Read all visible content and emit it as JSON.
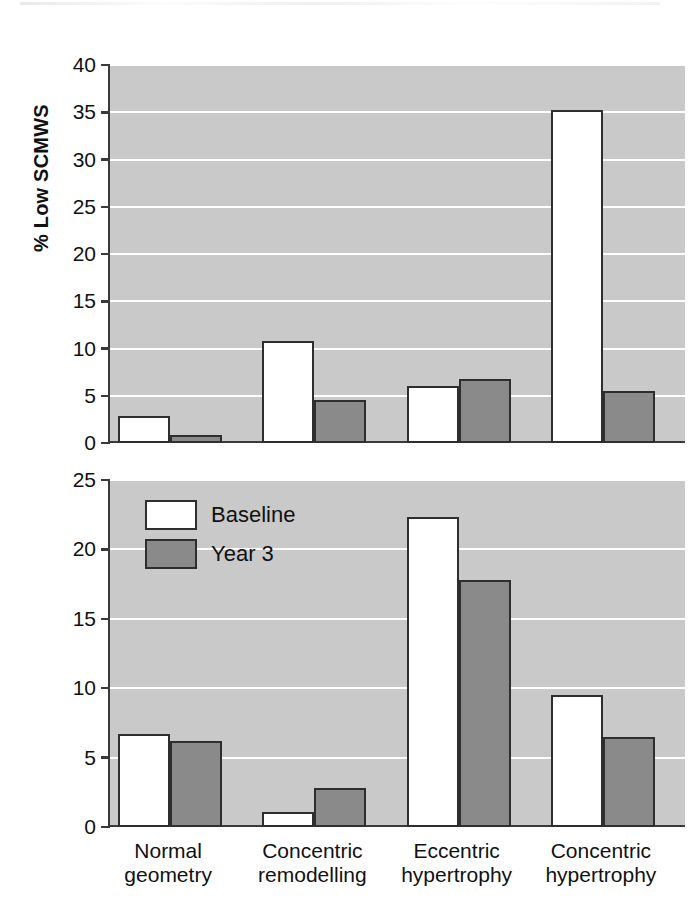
{
  "figure": {
    "width": 693,
    "height": 922,
    "background": "#ffffff",
    "plot_background": "#c9c9c9",
    "gridline_color": "#ffffff",
    "axis_color": "#3a3a3a",
    "bar_edge_color": "#2e2e2e"
  },
  "legend": {
    "position": "top-left of lower panel",
    "entries": [
      {
        "label": "Baseline",
        "color": "#ffffff",
        "swatch_name": "legend-swatch-baseline"
      },
      {
        "label": "Year 3",
        "color": "#8a8a8a",
        "swatch_name": "legend-swatch-year3"
      }
    ]
  },
  "chart_data": [
    {
      "type": "bar",
      "id": "scmws",
      "title": "",
      "ylabel": "% Low SCMWS",
      "xlabel": "",
      "ylim": [
        0,
        40
      ],
      "yticks": [
        0,
        5,
        10,
        15,
        20,
        25,
        30,
        35,
        40
      ],
      "ytick_labels": [
        "0",
        "5",
        "10",
        "15",
        "20",
        "25",
        "30",
        "35",
        "40"
      ],
      "grid": true,
      "grid_axis": "y",
      "categories": [
        "Normal\ngeometry",
        "Concentric\nremodelling",
        "Eccentric\nhypertrophy",
        "Concentric\nhypertrophy"
      ],
      "series": [
        {
          "name": "Baseline",
          "color": "#ffffff",
          "values": [
            2.9,
            10.8,
            6.0,
            35.2
          ]
        },
        {
          "name": "Year 3",
          "color": "#8a8a8a",
          "values": [
            0.8,
            4.5,
            6.8,
            5.5
          ]
        }
      ]
    },
    {
      "type": "bar",
      "id": "fs",
      "title": "",
      "ylabel": "% Low FS",
      "xlabel": "",
      "ylim": [
        0,
        25
      ],
      "yticks": [
        0,
        5,
        10,
        15,
        20,
        25
      ],
      "ytick_labels": [
        "0",
        "5",
        "10",
        "15",
        "20",
        "25"
      ],
      "grid": true,
      "grid_axis": "y",
      "categories": [
        "Normal\ngeometry",
        "Concentric\nremodelling",
        "Eccentric\nhypertrophy",
        "Concentric\nhypertrophy"
      ],
      "series": [
        {
          "name": "Baseline",
          "color": "#ffffff",
          "values": [
            6.7,
            1.1,
            22.3,
            9.5
          ]
        },
        {
          "name": "Year 3",
          "color": "#8a8a8a",
          "values": [
            6.2,
            2.8,
            17.8,
            6.5
          ]
        }
      ]
    }
  ],
  "axis_titles": {
    "top": "% Low SCMWS",
    "bottom": "% Low FS"
  },
  "category_labels": [
    {
      "line1": "Normal",
      "line2": "geometry"
    },
    {
      "line1": "Concentric",
      "line2": "remodelling"
    },
    {
      "line1": "Eccentric",
      "line2": "hypertrophy"
    },
    {
      "line1": "Concentric",
      "line2": "hypertrophy"
    }
  ]
}
